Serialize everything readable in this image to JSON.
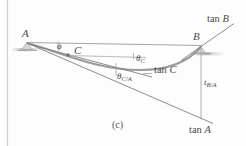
{
  "figure": {
    "caption": "(c)",
    "points": {
      "A": "A",
      "B": "B",
      "C": "C"
    },
    "tangent_labels": {
      "tan_A": "tan ",
      "tan_A_pt": "A",
      "tan_B": "tan ",
      "tan_B_pt": "B",
      "tan_C": "tan ",
      "tan_C_pt": "C"
    },
    "angle_labels": {
      "phi": "ϕ",
      "theta_C": "θ",
      "theta_C_sub": "C",
      "theta_C_over_A": "θ",
      "theta_C_over_A_sub": "C/A"
    },
    "deviation_labels": {
      "t_BA": "t",
      "t_BA_sub": "B/A"
    },
    "colors": {
      "curve": "#8f8f8f",
      "line": "#7d7d7d",
      "ground": "#b9b9b9",
      "text": "#4a4a4a",
      "frame": "#cfcfcf",
      "background": "#fdfdfd"
    },
    "geometry": {
      "A": [
        27,
        42
      ],
      "B": [
        201,
        46
      ],
      "C": [
        68,
        53
      ],
      "curve_min_x": 140,
      "tan_A_end": [
        212,
        123
      ],
      "tan_B_end": [
        233,
        24
      ],
      "tan_C_end": [
        150,
        76
      ],
      "t_BA_bottom": [
        201,
        118
      ]
    }
  }
}
